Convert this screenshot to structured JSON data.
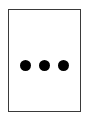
{
  "more_button": {
    "icon": "more-horizontal-icon",
    "dot_count": 3,
    "border_color": "#3a3a3a",
    "dot_color": "#000000",
    "background_color": "#ffffff"
  }
}
